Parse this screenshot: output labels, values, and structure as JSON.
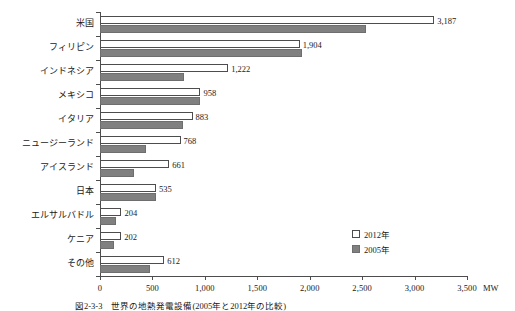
{
  "chart_data": {
    "type": "bar",
    "orientation": "horizontal",
    "title": "",
    "xlabel": "MW",
    "ylabel": "",
    "xlim": [
      0,
      3500
    ],
    "xticks": [
      0,
      500,
      1000,
      1500,
      2000,
      2500,
      3000,
      3500
    ],
    "xtick_labels": [
      "0",
      "500",
      "1,000",
      "1,500",
      "2,000",
      "2,500",
      "3,000",
      "3,500"
    ],
    "unit": "MW",
    "grid": false,
    "legend_position": "inside-bottom-right",
    "categories": [
      "米国",
      "フィリピン",
      "インドネシア",
      "メキシコ",
      "イタリア",
      "ニュージーランド",
      "アイスランド",
      "日本",
      "エルサルバドル",
      "ケニア",
      "その他"
    ],
    "series": [
      {
        "name": "2012年",
        "color": "#ffffff",
        "edge_color": "#4d4d4d",
        "values": [
          3187,
          1904,
          1222,
          958,
          883,
          768,
          661,
          535,
          204,
          202,
          612
        ],
        "value_labels": [
          "3,187",
          "1,904",
          "1,222",
          "958",
          "883",
          "768",
          "661",
          "535",
          "204",
          "202",
          "612"
        ]
      },
      {
        "name": "2005年",
        "color": "#808080",
        "edge_color": "#6e6e6e",
        "values": [
          2534,
          1930,
          797,
          953,
          791,
          435,
          322,
          535,
          151,
          129,
          480
        ],
        "value_labels": [
          "",
          "",
          "",
          "",
          "",
          "",
          "",
          "",
          "",
          "",
          ""
        ]
      }
    ]
  },
  "legend": {
    "items": [
      {
        "label": "2012年",
        "swatch": "white-square"
      },
      {
        "label": "2005年",
        "swatch": "gray-square"
      }
    ]
  },
  "axis": {
    "unit_label": "MW"
  },
  "caption": {
    "text": "図2-3-3　世界の地熱発電設備(2005年と2012年の比較)"
  }
}
